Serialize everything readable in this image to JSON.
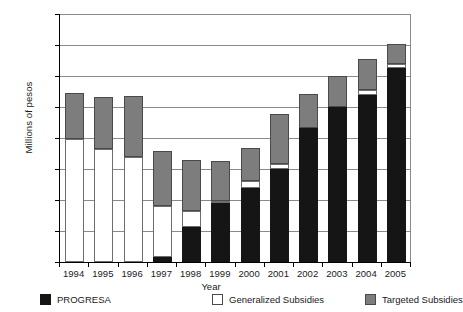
{
  "chart_data": {
    "type": "bar",
    "stacked": true,
    "title": "",
    "xlabel": "Year",
    "ylabel": "Millions of pesos",
    "categories": [
      "1994",
      "1995",
      "1996",
      "1997",
      "1998",
      "1999",
      "2000",
      "2001",
      "2002",
      "2003",
      "2004",
      "2005"
    ],
    "ylim": [
      0,
      40000
    ],
    "yticks": [
      0,
      5000,
      10000,
      15000,
      20000,
      25000,
      30000,
      35000,
      40000
    ],
    "ytick_labels": [
      "0",
      "5,000",
      "10,000",
      "15,000",
      "20,000",
      "25,000",
      "30,000",
      "35,000",
      "40,000"
    ],
    "grid": true,
    "legend_position": "bottom",
    "series": [
      {
        "name": "PROGRESA",
        "color": "#151515",
        "values": [
          0,
          0,
          0,
          800,
          5700,
          9500,
          12000,
          15000,
          21600,
          25000,
          27000,
          31300
        ]
      },
      {
        "name": "Generalized Subsidies",
        "color": "#ffffff",
        "values": [
          19800,
          18300,
          16900,
          8200,
          2600,
          300,
          1000,
          800,
          0,
          0,
          800,
          600
        ]
      },
      {
        "name": "Targeted Subsidies",
        "color": "#7d7d7d",
        "values": [
          7400,
          8300,
          9900,
          8900,
          8200,
          6500,
          5400,
          8000,
          5500,
          5000,
          5000,
          3300
        ]
      }
    ],
    "totals": [
      27200,
      26600,
      26800,
      17900,
      16500,
      16300,
      18400,
      23800,
      27100,
      30000,
      32800,
      35200
    ]
  },
  "legend": {
    "items": [
      {
        "label": "PROGRESA",
        "swatch": "progresa"
      },
      {
        "label": "Generalized Subsidies",
        "swatch": "generalized"
      },
      {
        "label": "Targeted Subsidies",
        "swatch": "targeted"
      }
    ]
  }
}
